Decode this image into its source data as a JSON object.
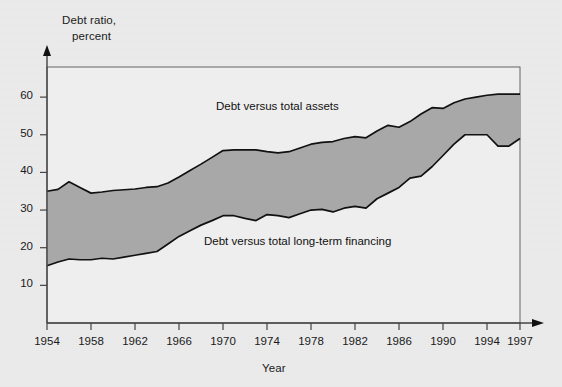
{
  "figure": {
    "background_color": "#ebebeb",
    "plot_background_color": "#eeeeee",
    "band_fill_color": "#a8a8a8",
    "line_color": "#111111",
    "axis_color": "#444444"
  },
  "axes": {
    "y_title_line1": "Debt ratio,",
    "y_title_line2": "percent",
    "x_title": "Year",
    "y_ticks": [
      "10",
      "20",
      "30",
      "40",
      "50",
      "60"
    ],
    "x_ticks": [
      "1954",
      "1958",
      "1962",
      "1966",
      "1970",
      "1974",
      "1978",
      "1982",
      "1986",
      "1990",
      "1994",
      "1997"
    ]
  },
  "labels": {
    "upper_series": "Debt versus total assets",
    "lower_series": "Debt versus total long-term financing"
  },
  "chart_data": {
    "type": "area",
    "title": "",
    "subtitle": "",
    "xlabel": "Year",
    "ylabel": "Debt ratio, percent",
    "xlim": [
      1954,
      1997
    ],
    "ylim": [
      0,
      68
    ],
    "yticks": [
      10,
      20,
      30,
      40,
      50,
      60
    ],
    "xticks": [
      1954,
      1958,
      1962,
      1966,
      1970,
      1974,
      1978,
      1982,
      1986,
      1990,
      1994,
      1997
    ],
    "grid": false,
    "legend_position": "inline-annotation",
    "annotations": [
      {
        "text": "Debt versus total assets",
        "x": 1970,
        "y": 55
      },
      {
        "text": "Debt versus total long-term financing",
        "x": 1969,
        "y": 22
      }
    ],
    "x": [
      1954,
      1955,
      1956,
      1957,
      1958,
      1959,
      1960,
      1961,
      1962,
      1963,
      1964,
      1965,
      1966,
      1967,
      1968,
      1969,
      1970,
      1971,
      1972,
      1973,
      1974,
      1975,
      1976,
      1977,
      1978,
      1979,
      1980,
      1981,
      1982,
      1983,
      1984,
      1985,
      1986,
      1987,
      1988,
      1989,
      1990,
      1991,
      1992,
      1993,
      1994,
      1995,
      1996,
      1997
    ],
    "series": [
      {
        "name": "Debt versus total assets",
        "values": [
          35.0,
          35.5,
          37.5,
          36.0,
          34.5,
          34.8,
          35.2,
          35.4,
          35.6,
          36.0,
          36.2,
          37.2,
          38.8,
          40.5,
          42.2,
          44.0,
          45.8,
          46.0,
          46.0,
          46.0,
          45.5,
          45.2,
          45.5,
          46.5,
          47.5,
          48.0,
          48.2,
          49.0,
          49.5,
          49.2,
          51.0,
          52.5,
          52.0,
          53.5,
          55.5,
          57.2,
          57.0,
          58.5,
          59.5,
          60.0,
          60.5,
          60.8,
          60.8,
          60.8
        ]
      },
      {
        "name": "Debt versus total long-term financing",
        "values": [
          15.2,
          16.2,
          17.0,
          16.8,
          16.8,
          17.2,
          17.0,
          17.5,
          18.0,
          18.5,
          19.0,
          21.0,
          23.0,
          24.5,
          26.0,
          27.2,
          28.5,
          28.5,
          27.8,
          27.2,
          28.8,
          28.5,
          28.0,
          29.0,
          30.0,
          30.2,
          29.5,
          30.5,
          31.0,
          30.5,
          33.0,
          34.5,
          36.0,
          38.5,
          39.0,
          41.5,
          44.5,
          47.5,
          50.0,
          50.0,
          50.0,
          47.0,
          47.0,
          49.0
        ]
      }
    ]
  }
}
